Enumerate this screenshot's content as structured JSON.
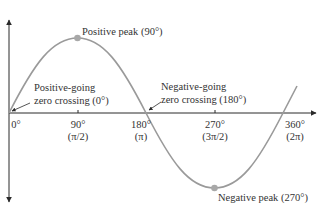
{
  "diagram": {
    "type": "sine-wave",
    "colors": {
      "axis": "#2a2a2a",
      "curve": "#9a9a9a",
      "dot": "#a8a8a8",
      "text": "#333333"
    },
    "annotations": {
      "positive_peak": "Positive peak (90°)",
      "negative_peak": "Negative peak (270°)",
      "pos_zero_line1": "Positive-going",
      "pos_zero_line2": "zero crossing (0°)",
      "neg_zero_line1": "Negative-going",
      "neg_zero_line2": "zero crossing (180°)"
    },
    "ticks": [
      {
        "deg": "0°",
        "rad": ""
      },
      {
        "deg": "90°",
        "rad": "(π/2)"
      },
      {
        "deg": "180°",
        "rad": "(π)"
      },
      {
        "deg": "270°",
        "rad": "(3π/2)"
      },
      {
        "deg": "360°",
        "rad": "(2π)"
      }
    ]
  }
}
